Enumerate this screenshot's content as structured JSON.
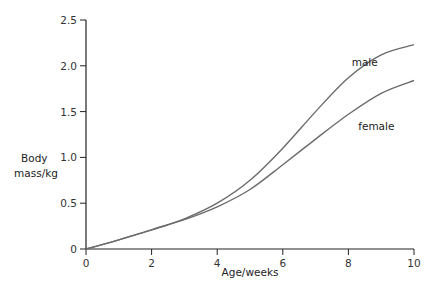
{
  "chart_data": {
    "type": "line",
    "title": "",
    "xlabel": "Age/weeks",
    "ylabel": "Body mass/kg",
    "ylabel_lines": [
      "Body",
      "mass/kg"
    ],
    "xlim": [
      0,
      10
    ],
    "ylim": [
      0,
      2.5
    ],
    "x_ticks": [
      0,
      2,
      4,
      6,
      8,
      10
    ],
    "x_tick_labels": [
      "0",
      "2",
      "4",
      "6",
      "8",
      "10"
    ],
    "y_ticks": [
      0,
      0.5,
      1.0,
      1.5,
      2.0,
      2.5
    ],
    "y_tick_labels": [
      "0",
      "0.5",
      "1.0",
      "1.5",
      "2.0",
      "2.5"
    ],
    "grid": false,
    "legend": "inline labels near curve ends",
    "x": [
      0,
      1,
      2,
      3,
      4,
      5,
      6,
      7,
      8,
      9,
      10
    ],
    "series": [
      {
        "name": "male",
        "label_pos": [
          8.1,
          2.0
        ],
        "values": [
          0,
          0.1,
          0.21,
          0.33,
          0.5,
          0.75,
          1.1,
          1.5,
          1.87,
          2.12,
          2.23
        ]
      },
      {
        "name": "female",
        "label_pos": [
          8.3,
          1.3
        ],
        "values": [
          0,
          0.1,
          0.21,
          0.32,
          0.46,
          0.65,
          0.92,
          1.2,
          1.47,
          1.7,
          1.84
        ]
      }
    ],
    "colors": {
      "axis": "#222222",
      "line": "#6b6b6b"
    }
  }
}
